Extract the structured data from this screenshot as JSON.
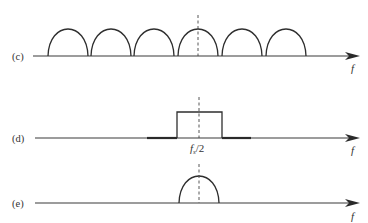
{
  "figure": {
    "panels": [
      {
        "id": "c",
        "label": "(c)",
        "axis_label": "f",
        "description": "Periodic replicated spectrum: six identical half-arch lobes along frequency axis",
        "lobe_count": 6
      },
      {
        "id": "d",
        "label": "(d)",
        "axis_label": "f",
        "description": "Ideal rectangular low-pass/band filter centered at fs/2 with thick stopband lines",
        "center_label_main": "f",
        "center_label_sub": "s",
        "center_label_rest": "/2"
      },
      {
        "id": "e",
        "label": "(e)",
        "axis_label": "f",
        "description": "Single filtered spectral lobe centered at fs/2"
      }
    ],
    "colors": {
      "line": "#2e2e2e",
      "background": "#ffffff"
    }
  }
}
